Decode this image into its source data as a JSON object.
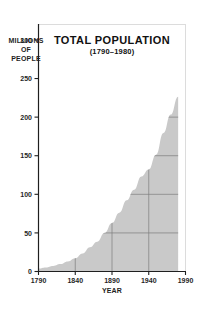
{
  "figure": {
    "background_color": "#ffffff",
    "frame_color": "#d9d9d9",
    "axis_color": "#1f1f1f",
    "fill_color": "#c9c9c9",
    "gridline_color": "#7d7d7d"
  },
  "labels": {
    "y_axis_line1": "MILLIONS",
    "y_axis_line2": "OF",
    "y_axis_line3": "PEOPLE",
    "x_axis_title": "YEAR"
  },
  "chart_data": {
    "type": "area",
    "title": "TOTAL POPULATION",
    "subtitle": "(1790–1980)",
    "xlabel": "YEAR",
    "ylabel": "MILLIONS OF PEOPLE",
    "xlim": [
      1790,
      1990
    ],
    "ylim": [
      0,
      320
    ],
    "xticks": [
      1790,
      1840,
      1890,
      1940,
      1990
    ],
    "xtick_labels": [
      "1790",
      "1840",
      "1890",
      "1940",
      "1990"
    ],
    "yticks": [
      0,
      50,
      100,
      150,
      200,
      250,
      300
    ],
    "ytick_labels": [
      "0",
      "50",
      "100",
      "150",
      "200",
      "250",
      "300"
    ],
    "grid": true,
    "grid_clipped_to_area": true,
    "legend": false,
    "fill_color": "#c9c9c9",
    "series": [
      {
        "name": "Total Population",
        "x": [
          1790,
          1800,
          1810,
          1820,
          1830,
          1840,
          1850,
          1860,
          1870,
          1880,
          1890,
          1900,
          1910,
          1920,
          1930,
          1940,
          1950,
          1960,
          1970,
          1980
        ],
        "values": [
          3.9,
          5.3,
          7.2,
          9.6,
          12.9,
          17.1,
          23.2,
          31.4,
          38.6,
          50.2,
          62.9,
          76.2,
          92.2,
          106.0,
          123.2,
          132.2,
          151.3,
          179.3,
          203.3,
          226.5
        ]
      }
    ]
  }
}
